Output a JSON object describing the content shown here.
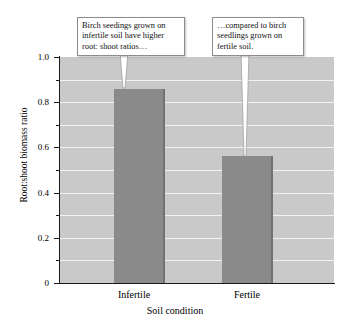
{
  "chart_data": {
    "type": "bar",
    "title": "",
    "xlabel": "Soil condition",
    "ylabel": "Root:shoot biomass ratio",
    "categories": [
      "Infertile",
      "Fertile"
    ],
    "values": [
      0.86,
      0.56
    ],
    "ylim": [
      0,
      1.0
    ],
    "ytick_labels": [
      "0",
      "0.2",
      "0.4",
      "0.6",
      "0.8",
      "1.0"
    ],
    "ytick_values": [
      0,
      0.2,
      0.4,
      0.6,
      0.8,
      1.0
    ],
    "minor_tick_values": [
      0.1,
      0.3,
      0.5,
      0.7,
      0.9
    ],
    "gridline_values": [
      0.1,
      0.2,
      0.3,
      0.4,
      0.5,
      0.6,
      0.7,
      0.8,
      0.9
    ],
    "grid": true,
    "legend": "none",
    "bar_color": "#8a8a8a",
    "plot_background_color": "#c9c9c9",
    "gridline_color": "#f2f2f2",
    "axis_color": "#1a1a1a",
    "annotations": [
      {
        "name": "infertile-callout",
        "text": "Birch seedings grown on infertile soil have higher root: shoot ratios…",
        "points_to_category": "Infertile"
      },
      {
        "name": "fertile-callout",
        "text": "…compared to birch seedlings grown on fertile soil.",
        "points_to_category": "Fertile"
      }
    ]
  },
  "axis": {
    "y_title": "Root:shoot biomass ratio",
    "x_title": "Soil condition",
    "y_labels": {
      "t0": "0",
      "t1": "0.2",
      "t2": "0.4",
      "t3": "0.6",
      "t4": "0.8",
      "t5": "1.0"
    },
    "x_labels": {
      "c0": "Infertile",
      "c1": "Fertile"
    }
  },
  "callouts": {
    "infertile": "Birch seedings grown on infertile soil have higher root: shoot ratios…",
    "fertile": "…compared to birch seedlings grown on fertile soil."
  }
}
